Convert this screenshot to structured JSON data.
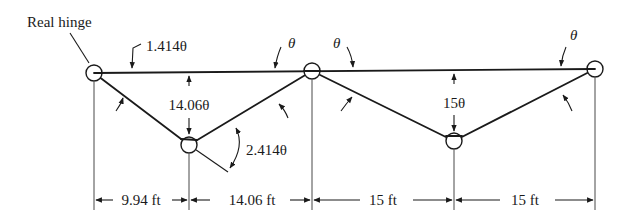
{
  "diagram": {
    "title_callout": "Real hinge",
    "rotation_labels": {
      "top_left_member": "1.414θ",
      "top_mid_left": "θ",
      "top_mid_right": "θ",
      "top_right": "θ",
      "bottom_left_node": "2.414θ"
    },
    "deflection_labels": {
      "left_span": "14.06θ",
      "right_span": "15θ"
    },
    "dimensions": [
      {
        "label": "9.94 ft",
        "value_ft": 9.94
      },
      {
        "label": "14.06 ft",
        "value_ft": 14.06
      },
      {
        "label": "15 ft",
        "value_ft": 15
      },
      {
        "label": "15 ft",
        "value_ft": 15
      }
    ],
    "nodes": [
      {
        "name": "left-real-hinge"
      },
      {
        "name": "bottom-left-hinge"
      },
      {
        "name": "top-middle-hinge"
      },
      {
        "name": "bottom-right-hinge"
      },
      {
        "name": "right-hinge"
      }
    ],
    "colors": {
      "ink": "#1a1a1a",
      "background": "#ffffff"
    }
  }
}
